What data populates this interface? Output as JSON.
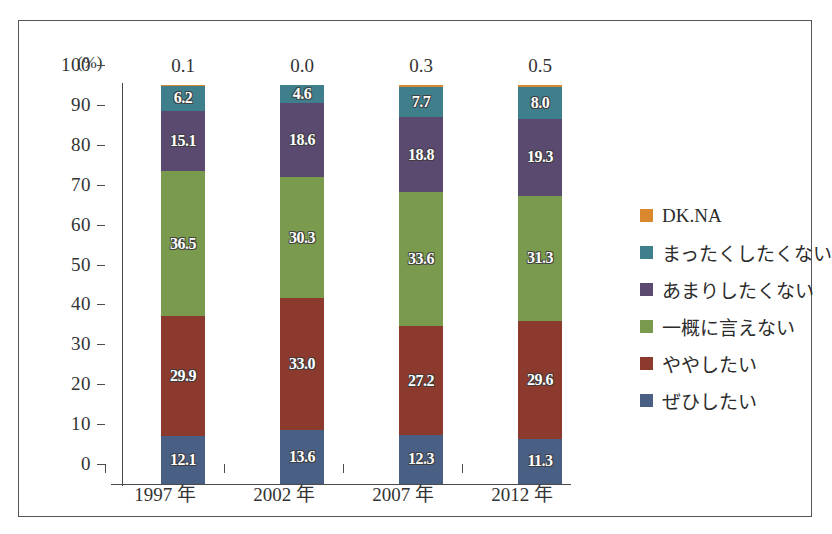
{
  "chart_data": {
    "type": "bar",
    "title": "",
    "subtitle": "",
    "stacked": true,
    "stack_mode": "percent",
    "xlabel": "",
    "ylabel": "(%)",
    "ylim": [
      0,
      100
    ],
    "ytick_step": 10,
    "grid": false,
    "legend_position": "right",
    "categories": [
      "1997 年",
      "2002 年",
      "2007 年",
      "2012 年"
    ],
    "yticks": [
      "100",
      "90",
      "80",
      "70",
      "60",
      "50",
      "40",
      "30",
      "20",
      "10",
      "0"
    ],
    "series": [
      {
        "name": "ぜひしたい",
        "color": "#4a5f84",
        "values": [
          12.1,
          13.6,
          12.3,
          11.3
        ],
        "labels": [
          "12.1",
          "13.6",
          "12.3",
          "11.3"
        ],
        "label_inside": true
      },
      {
        "name": "ややしたい",
        "color": "#8c3a2e",
        "values": [
          29.9,
          33.0,
          27.2,
          29.6
        ],
        "labels": [
          "29.9",
          "33.0",
          "27.2",
          "29.6"
        ],
        "label_inside": true
      },
      {
        "name": "一概に言えない",
        "color": "#7a9a4e",
        "values": [
          36.5,
          30.3,
          33.6,
          31.3
        ],
        "labels": [
          "36.5",
          "30.3",
          "33.6",
          "31.3"
        ],
        "label_inside": true
      },
      {
        "name": "あまりしたくない",
        "color": "#5b4a70",
        "values": [
          15.1,
          18.6,
          18.8,
          19.3
        ],
        "labels": [
          "15.1",
          "18.6",
          "18.8",
          "19.3"
        ],
        "label_inside": true
      },
      {
        "name": "まったくしたくない",
        "color": "#3f7f8c",
        "values": [
          6.2,
          4.6,
          7.7,
          8.0
        ],
        "labels": [
          "6.2",
          "4.6",
          "7.7",
          "8.0"
        ],
        "label_inside": true
      },
      {
        "name": "DK.NA",
        "color": "#d9882e",
        "values": [
          0.1,
          0.0,
          0.3,
          0.5
        ],
        "labels": [
          "0.1",
          "0.0",
          "0.3",
          "0.5"
        ],
        "label_inside": false
      }
    ],
    "legend_entries": [
      {
        "label": "DK.NA",
        "color": "#d9882e"
      },
      {
        "label": "まったくしたくない",
        "color": "#3f7f8c"
      },
      {
        "label": "あまりしたくない",
        "color": "#5b4a70"
      },
      {
        "label": "一概に言えない",
        "color": "#7a9a4e"
      },
      {
        "label": "ややしたい",
        "color": "#8c3a2e"
      },
      {
        "label": "ぜひしたい",
        "color": "#4a5f84"
      }
    ]
  }
}
